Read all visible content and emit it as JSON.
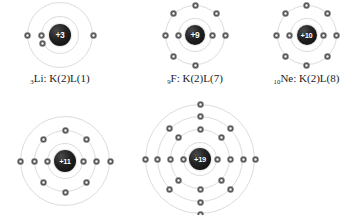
{
  "figure": {
    "type": "bohr-atomic-models",
    "background_color": "#ffffff",
    "electron_color": "#4a4a4a",
    "shell_color": "#dcdcdc",
    "nucleus_color": "#1a1a1a",
    "nucleus_text_color": "#ffffff"
  },
  "atoms": [
    {
      "id": "lithium",
      "nucleus_label": "+3",
      "nucleus_size": 22,
      "caption_atomic_number": "3",
      "caption_symbol": "Li",
      "caption_config": ": K(2)L(1)",
      "caption_full": "3Li: K(2)L(1)",
      "shells": [
        {
          "radius": 19,
          "electrons": 2,
          "angles": [
            180,
            205
          ]
        },
        {
          "radius": 33,
          "electrons": 1,
          "angles": [
            180
          ]
        }
      ],
      "extra_electrons": [
        {
          "radius": 33,
          "angle": 0
        }
      ]
    },
    {
      "id": "fluorine",
      "nucleus_label": "+9",
      "nucleus_size": 20,
      "caption_atomic_number": "9",
      "caption_symbol": "F",
      "caption_config": ": K(2)L(7)",
      "caption_full": "9F: K(2)L(7)",
      "shells": [
        {
          "radius": 17,
          "electrons": 2,
          "angles": [
            180,
            0
          ]
        },
        {
          "radius": 30,
          "electrons": 7,
          "angles": [
            180,
            0,
            90,
            270,
            135,
            45,
            225
          ]
        }
      ],
      "extra_electrons": []
    },
    {
      "id": "neon",
      "nucleus_label": "+10",
      "nucleus_size": 20,
      "caption_atomic_number": "10",
      "caption_symbol": "Ne",
      "caption_config": ": K(2)L(8)",
      "caption_full": "10Ne: K(2)L(8)",
      "shells": [
        {
          "radius": 17,
          "electrons": 2,
          "angles": [
            180,
            0
          ]
        },
        {
          "radius": 30,
          "electrons": 8,
          "angles": [
            0,
            45,
            90,
            135,
            180,
            225,
            270,
            315
          ]
        }
      ],
      "extra_electrons": []
    },
    {
      "id": "sodium",
      "nucleus_label": "+11",
      "nucleus_size": 22,
      "caption_atomic_number": "",
      "caption_symbol": "",
      "caption_config": "",
      "caption_full": "",
      "shells": [
        {
          "radius": 18,
          "electrons": 2,
          "angles": [
            180,
            0
          ]
        },
        {
          "radius": 31,
          "electrons": 8,
          "angles": [
            0,
            45,
            90,
            135,
            180,
            225,
            270,
            315
          ]
        },
        {
          "radius": 45,
          "electrons": 1,
          "angles": [
            180
          ]
        }
      ],
      "extra_electrons": [
        {
          "radius": 45,
          "angle": 0
        }
      ]
    },
    {
      "id": "potassium",
      "nucleus_label": "+19",
      "nucleus_size": 22,
      "caption_atomic_number": "",
      "caption_symbol": "",
      "caption_config": "",
      "caption_full": "",
      "shells": [
        {
          "radius": 17,
          "electrons": 2,
          "angles": [
            180,
            0
          ]
        },
        {
          "radius": 30,
          "electrons": 8,
          "angles": [
            0,
            45,
            90,
            135,
            180,
            225,
            270,
            315
          ]
        },
        {
          "radius": 43,
          "electrons": 8,
          "angles": [
            0,
            45,
            90,
            135,
            180,
            225,
            270,
            315
          ]
        },
        {
          "radius": 55,
          "electrons": 4,
          "angles": [
            0,
            90,
            180,
            270
          ]
        }
      ],
      "extra_electrons": []
    }
  ]
}
